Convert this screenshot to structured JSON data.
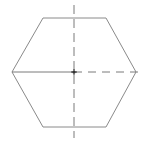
{
  "diagram": {
    "shape": "hexagon",
    "stroke_color": "#8a8a8a",
    "axis_color": "#7a7a7a",
    "center_color": "#333333",
    "vertices": [
      [
        43,
        18
      ],
      [
        106,
        18
      ],
      [
        136,
        72
      ],
      [
        106,
        127
      ],
      [
        43,
        127
      ],
      [
        12,
        72
      ]
    ],
    "center": [
      74,
      72
    ],
    "horizontal_axis": {
      "from": [
        12,
        72
      ],
      "to": [
        140,
        72
      ],
      "style": "solid-left-dashed-right"
    },
    "vertical_axis": {
      "from": [
        74,
        5
      ],
      "to": [
        74,
        138
      ],
      "style": "dashed"
    }
  }
}
